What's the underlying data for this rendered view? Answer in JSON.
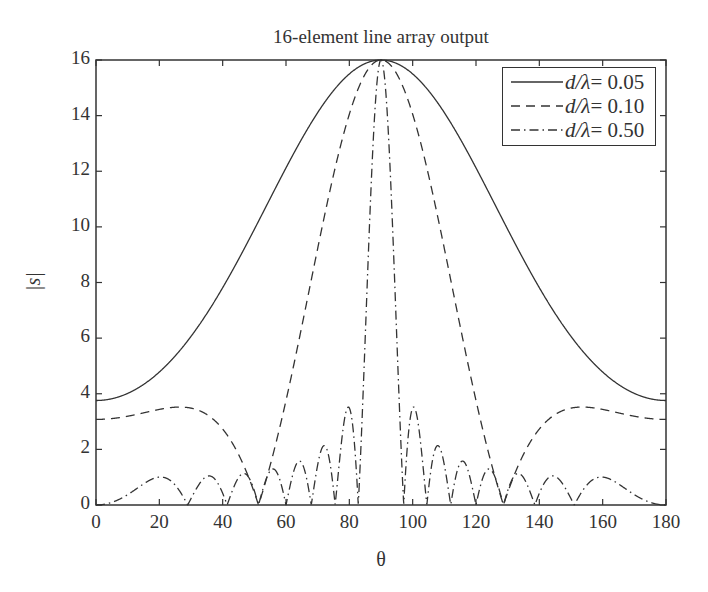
{
  "chart_data": {
    "type": "line",
    "title": "16-element line array output",
    "xlabel": "θ",
    "ylabel": "|s|",
    "xlim": [
      0,
      180
    ],
    "ylim": [
      0,
      16
    ],
    "xticks": [
      0,
      20,
      40,
      60,
      80,
      100,
      120,
      140,
      160,
      180
    ],
    "yticks": [
      0,
      2,
      4,
      6,
      8,
      10,
      12,
      14,
      16
    ],
    "grid": false,
    "legend_position": "upper right",
    "model": "|s| = |sin(N·π·(d/λ)·cosθ) / sin(π·(d/λ)·cosθ)|, N = 16",
    "N": 16,
    "series": [
      {
        "name": "d/λ = 0.05",
        "d_over_lambda": 0.05,
        "style": "solid",
        "sample_points": {
          "x": [
            0,
            20,
            40,
            60,
            80,
            90,
            100,
            120,
            140,
            160,
            180
          ],
          "y": [
            3.76,
            4.44,
            6.97,
            11.01,
            15.13,
            16.0,
            15.13,
            11.01,
            6.97,
            4.44,
            3.76
          ]
        }
      },
      {
        "name": "d/λ = 0.10",
        "d_over_lambda": 0.1,
        "style": "dashed",
        "sample_points": {
          "x": [
            0,
            20,
            30,
            40,
            50,
            60,
            70,
            80,
            90,
            100,
            110,
            120,
            130,
            140,
            150,
            160,
            180
          ],
          "y": [
            3.08,
            3.45,
            3.53,
            3.2,
            1.9,
            0.0,
            5.9,
            12.4,
            16.0,
            12.4,
            5.9,
            0.0,
            1.9,
            3.2,
            3.53,
            3.45,
            3.08
          ]
        }
      },
      {
        "name": "d/λ = 0.50",
        "d_over_lambda": 0.5,
        "style": "dashdot",
        "sample_points": {
          "x": [
            0,
            21,
            29,
            36,
            41,
            51,
            58,
            62,
            69,
            75,
            79,
            83,
            86,
            90,
            94,
            97,
            101,
            105,
            111,
            118,
            122,
            129,
            139,
            144,
            151,
            159,
            180
          ],
          "y": [
            0.0,
            1.03,
            0.0,
            1.04,
            0.0,
            1.12,
            0.0,
            1.42,
            0.0,
            2.05,
            0.0,
            3.46,
            0.0,
            16.0,
            0.0,
            3.46,
            0.0,
            2.05,
            0.0,
            1.42,
            0.0,
            1.12,
            0.0,
            1.04,
            0.0,
            1.03,
            0.0
          ]
        }
      }
    ]
  },
  "legend": {
    "items": [
      {
        "var": "d/λ",
        "value": "= 0.05"
      },
      {
        "var": "d/λ",
        "value": "= 0.10"
      },
      {
        "var": "d/λ",
        "value": "= 0.50"
      }
    ]
  },
  "colors": {
    "line": "#333333",
    "axis": "#333333",
    "background": "#ffffff"
  }
}
